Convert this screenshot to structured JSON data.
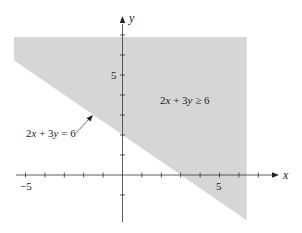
{
  "chart_data": {
    "type": "area",
    "title": "",
    "xlabel": "x",
    "ylabel": "y",
    "xlim": [
      -5.6,
      6.4
    ],
    "ylim": [
      -2.4,
      6.9
    ],
    "x_axis_range_drawn": [
      -5.5,
      8.1
    ],
    "y_axis_range_drawn": [
      -2.6,
      7.6
    ],
    "x_ticks": [
      -5,
      -4,
      -3,
      -2,
      -1,
      0,
      1,
      2,
      3,
      4,
      5,
      6,
      7
    ],
    "y_ticks": [
      -1,
      0,
      1,
      2,
      3,
      4,
      5,
      6,
      7
    ],
    "x_tick_labels": [
      {
        "value": -5,
        "label": "−5"
      },
      {
        "value": 5,
        "label": "5"
      }
    ],
    "y_tick_labels": [
      {
        "value": 5,
        "label": "5"
      }
    ],
    "grid": false,
    "legend": null,
    "boundary_line": {
      "equation": "2x + 3y = 6",
      "points": [
        [
          -5.6,
          5.733
        ],
        [
          6.4,
          -2.267
        ]
      ],
      "x_intercept": [
        3,
        0
      ],
      "y_intercept": [
        0,
        2
      ],
      "style": "solid"
    },
    "shaded_region": {
      "inequality": "2x + 3y ≥ 6",
      "polygon": [
        [
          -5.6,
          6.9
        ],
        [
          6.4,
          6.9
        ],
        [
          6.4,
          -2.267
        ],
        [
          -5.6,
          5.733
        ]
      ],
      "color": "#d6d6d6"
    },
    "annotations": [
      {
        "text": "2x + 3y = 6",
        "type": "line-label",
        "arrow_to": [
          -1.5,
          3.0
        ]
      },
      {
        "text": "2x + 3y ≥ 6",
        "type": "region-label",
        "position": [
          2.4,
          3.75
        ]
      }
    ]
  },
  "labels": {
    "x_axis": "x",
    "y_axis": "y",
    "x_tick_neg5": "−5",
    "x_tick_5": "5",
    "y_tick_5": "5",
    "line_label_left": "2x + 3y = 6",
    "line_label_parts": {
      "a": "2",
      "x": "x",
      "plus": " + 3",
      "y": "y",
      "eq": " = 6"
    },
    "region_label_parts": {
      "a": "2",
      "x": "x",
      "plus": " + 3",
      "y": "y",
      "ge": " ≥ 6"
    }
  },
  "colors": {
    "shade": "#d6d6d6",
    "axis": "#333333",
    "text": "#222222"
  }
}
